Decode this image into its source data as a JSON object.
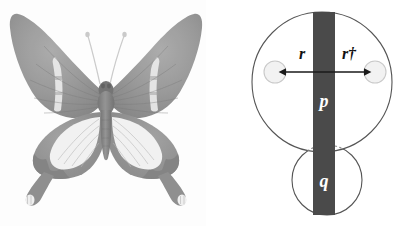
{
  "figure": {
    "background_color": "#ffffff",
    "panels": [
      {
        "id": "specimen-photo",
        "type": "photograph",
        "subject": "butterfly-specimen",
        "rendering": "grayscale",
        "description": "Dorsal view of a pinned swallowtail butterfly specimen with pale bands on the forewings, large pale patches on the hindwings and spatulate hindwing tails."
      },
      {
        "id": "schematic-diagram",
        "type": "diagram",
        "description": "Large circle intersected by a vertical dark bar, with a smaller circle below and a double-headed horizontal arrow connecting two small circles."
      }
    ]
  },
  "diagram": {
    "colors": {
      "bar": "#4a4a4a",
      "outline": "#555555",
      "node_fill": "#f2f2f2",
      "node_stroke": "#c9c9c9",
      "arrow": "#1a1a1a",
      "dotted_arc": "#8a8a8a",
      "label_on_bar": "#ffffff",
      "label_text": "#111111"
    },
    "labels": {
      "bar_upper": "p",
      "bar_lower": "q",
      "arrow_left": "r",
      "arrow_right": "r†"
    },
    "shapes": {
      "upper_circle": {
        "cx": 322,
        "cy": 82,
        "r": 70
      },
      "lower_circle": {
        "cx": 327,
        "cy": 180,
        "r": 35
      },
      "bar": {
        "x": 313,
        "y": 12,
        "width": 22,
        "height": 203
      },
      "node_left": {
        "cx": 275,
        "cy": 72,
        "r": 11
      },
      "node_right": {
        "cx": 375,
        "cy": 72,
        "r": 11
      },
      "arrow": {
        "x1": 270,
        "x2": 380,
        "y": 72
      }
    }
  },
  "photo": {
    "colors": {
      "wing_dark": "#8d8d8d",
      "wing_mid": "#a3a3a3",
      "wing_pale": "#e6e6e6",
      "wing_white": "#f4f4f4",
      "body": "#7e7e7e",
      "antenna": "#bdbdbd",
      "background": "#fdfdfd"
    }
  }
}
